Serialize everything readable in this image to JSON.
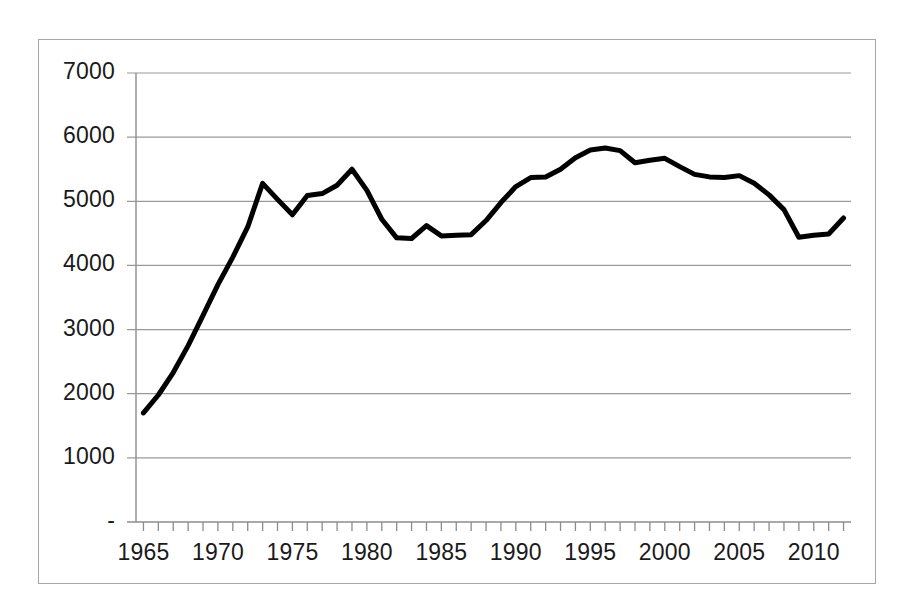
{
  "figure": {
    "background_color": "#ffffff",
    "border_color": "#a6a6a6",
    "plot_area": {
      "left": 135,
      "right": 850,
      "top": 72,
      "bottom": 521
    }
  },
  "chart_data": {
    "type": "line",
    "title": "",
    "subtitle": "",
    "xlabel": "",
    "ylabel": "",
    "xlim": [
      1964.5,
      2012.5
    ],
    "ylim": [
      0,
      7000
    ],
    "grid": true,
    "grid_axis": "y",
    "legend": false,
    "legend_position": "none",
    "line_color": "#000000",
    "line_width": 5,
    "ytick_labels": [
      "7000",
      "6000",
      "5000",
      "4000",
      "3000",
      "2000",
      "1000",
      "-"
    ],
    "ytick_values": [
      7000,
      6000,
      5000,
      4000,
      3000,
      2000,
      1000,
      0
    ],
    "xtick_labels": [
      "1965",
      "1970",
      "1975",
      "1980",
      "1985",
      "1990",
      "1995",
      "2000",
      "2005",
      "2010"
    ],
    "xtick_values": [
      1965,
      1970,
      1975,
      1980,
      1985,
      1990,
      1995,
      2000,
      2005,
      2010
    ],
    "x_minor_ticks_every": 1,
    "x": [
      1965,
      1966,
      1967,
      1968,
      1969,
      1970,
      1971,
      1972,
      1973,
      1974,
      1975,
      1976,
      1977,
      1978,
      1979,
      1980,
      1981,
      1982,
      1983,
      1984,
      1985,
      1986,
      1987,
      1988,
      1989,
      1990,
      1991,
      1992,
      1993,
      1994,
      1995,
      1996,
      1997,
      1998,
      1999,
      2000,
      2001,
      2002,
      2003,
      2004,
      2005,
      2006,
      2007,
      2008,
      2009,
      2010,
      2011,
      2012
    ],
    "values": [
      1700,
      1980,
      2330,
      2750,
      3220,
      3700,
      4130,
      4600,
      5280,
      5030,
      4790,
      5090,
      5120,
      5250,
      5500,
      5170,
      4720,
      4430,
      4420,
      4620,
      4460,
      4470,
      4480,
      4700,
      4980,
      5230,
      5370,
      5380,
      5500,
      5680,
      5800,
      5830,
      5790,
      5600,
      5640,
      5670,
      5540,
      5420,
      5380,
      5370,
      5400,
      5280,
      5100,
      4870,
      4440,
      4470,
      4490,
      4740
    ],
    "series": [
      {
        "name": "series-1",
        "values": [
          1700,
          1980,
          2330,
          2750,
          3220,
          3700,
          4130,
          4600,
          5280,
          5030,
          4790,
          5090,
          5120,
          5250,
          5500,
          5170,
          4720,
          4430,
          4420,
          4620,
          4460,
          4470,
          4480,
          4700,
          4980,
          5230,
          5370,
          5380,
          5500,
          5680,
          5800,
          5830,
          5790,
          5600,
          5640,
          5670,
          5540,
          5420,
          5380,
          5370,
          5400,
          5280,
          5100,
          4870,
          4440,
          4470,
          4490,
          4740
        ]
      }
    ]
  }
}
